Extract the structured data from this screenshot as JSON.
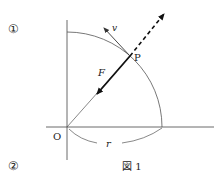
{
  "markers": {
    "top": "①",
    "bottom": "②"
  },
  "figure": {
    "caption": "図 1",
    "labels": {
      "origin": "O",
      "point": "P",
      "velocity": "v",
      "force": "F",
      "radius": "r"
    }
  },
  "colors": {
    "line": "#333333",
    "arrow": "#111111"
  }
}
